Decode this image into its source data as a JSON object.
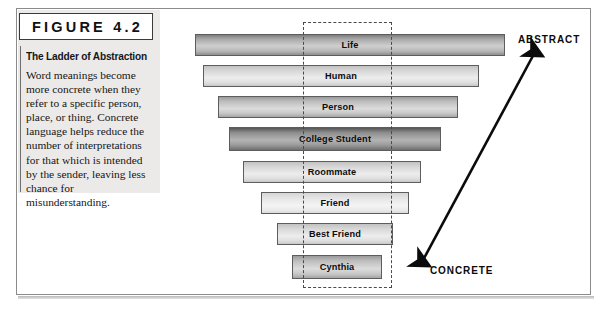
{
  "figure": {
    "tag": "FIGURE 4.2",
    "heading": "The Ladder of Abstraction",
    "body": "Word meanings become more concrete when they refer to a specific person, place, or thing. Concrete language helps reduce the number of interpretations for that which is intended by the sender, leaving less chance for misunderstanding."
  },
  "axis": {
    "top_label": "ABSTRACT",
    "bottom_label": "CONCRETE"
  },
  "colors": {
    "panel_background": "#eceae8",
    "frame_border": "#8b8b8b",
    "bar_border": "#5d5d5d",
    "dashed_border": "#4a4a4a",
    "text": "#0d0d0d"
  },
  "chart_data": {
    "type": "bar",
    "title": "The Ladder of Abstraction",
    "orientation": "horizontal",
    "xlabel": "",
    "ylabel": "",
    "grid": false,
    "legend": null,
    "note": "Inverted funnel: bar width decreases from most abstract (Life) to most concrete (Cynthia).",
    "categories": [
      "Life",
      "Human",
      "Person",
      "College Student",
      "Roommate",
      "Friend",
      "Best Friend",
      "Cynthia"
    ],
    "values": [
      310,
      276,
      240,
      212,
      178,
      148,
      116,
      90
    ],
    "xlim": [
      0,
      310
    ],
    "rungs": [
      {
        "label": "Life",
        "left": 195,
        "top": 34,
        "width": 310,
        "height": 22,
        "shade": "dark"
      },
      {
        "label": "Human",
        "left": 203,
        "top": 65,
        "width": 276,
        "height": 22,
        "shade": "light"
      },
      {
        "label": "Person",
        "left": 218,
        "top": 96,
        "width": 240,
        "height": 22,
        "shade": "medium"
      },
      {
        "label": "College Student",
        "left": 229,
        "top": 127,
        "width": 212,
        "height": 24,
        "shade": "darkest"
      },
      {
        "label": "Roommate",
        "left": 243,
        "top": 161,
        "width": 178,
        "height": 22,
        "shade": "light"
      },
      {
        "label": "Friend",
        "left": 261,
        "top": 192,
        "width": 148,
        "height": 22,
        "shade": "pale"
      },
      {
        "label": "Best Friend",
        "left": 277,
        "top": 223,
        "width": 116,
        "height": 22,
        "shade": "light"
      },
      {
        "label": "Cynthia",
        "left": 292,
        "top": 255,
        "width": 90,
        "height": 24,
        "shade": "medium"
      }
    ]
  }
}
